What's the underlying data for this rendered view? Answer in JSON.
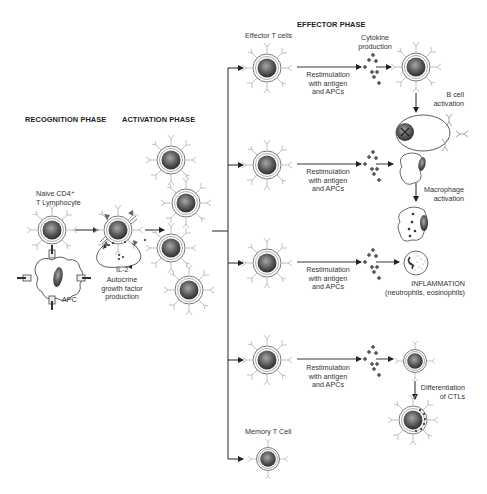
{
  "phases": {
    "recognition": "RECOGNITION  PHASE",
    "activation": "ACTIVATION PHASE",
    "effector": "EFFECTOR PHASE"
  },
  "recognition": {
    "naive_label_line1": "Naive CD4⁺",
    "naive_label_line2": "T Lymphocyte",
    "apc_label": "APC"
  },
  "activation": {
    "il2_label": "IL-2",
    "autocrine_line1": "Autocrine",
    "autocrine_line2": "growth factor",
    "autocrine_line3": "production"
  },
  "effector": {
    "effector_cells_label": "Effector T cells",
    "cytokine_line1": "Cytokine",
    "cytokine_line2": "production",
    "restim_line1": "Restimulation",
    "restim_line2": "with antigen",
    "restim_line3": "and APCs",
    "outcomes": [
      {
        "line1": "B cell",
        "line2": "activation"
      },
      {
        "line1": "Macrophage",
        "line2": "activation"
      },
      {
        "line1": "INFLAMMATION",
        "line2": "(neutrophils, eosinophils)"
      },
      {
        "line1": "Differentiation",
        "line2": "of CTLs"
      }
    ],
    "memory_label": "Memory T Cell"
  },
  "colors": {
    "line": "#222222",
    "receptor": "#b0b0b0",
    "nucleus_dark": "#3a3a3a",
    "nucleus_light": "#9a9a9a",
    "dot": "#555555"
  }
}
